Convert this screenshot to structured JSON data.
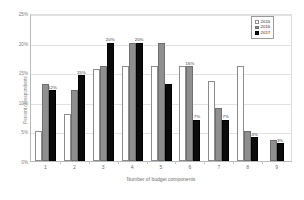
{
  "chart_data": {
    "type": "bar",
    "title": "",
    "xlabel": "Number of budget components",
    "ylabel": "Percent of respondents",
    "categories": [
      "1",
      "2",
      "3",
      "4",
      "5",
      "6",
      "7",
      "8",
      "9"
    ],
    "ylim": [
      0,
      25
    ],
    "yticks": [
      "0%",
      "5%",
      "10%",
      "15%",
      "20%",
      "25%"
    ],
    "ytick_values": [
      0,
      5,
      10,
      15,
      20,
      25
    ],
    "grid": true,
    "legend_position": "top-right",
    "series": [
      {
        "name": "2015",
        "color": "#ffffff",
        "values": [
          5,
          8,
          15.5,
          16,
          16,
          16,
          13.5,
          16,
          0
        ],
        "labels": [
          "",
          "",
          "",
          "",
          "",
          "",
          "",
          "",
          ""
        ]
      },
      {
        "name": "2016",
        "color": "#8f8f8f",
        "values": [
          13,
          12,
          16,
          20,
          20,
          16,
          9,
          5,
          3.5
        ],
        "labels": [
          "",
          "",
          "",
          "",
          "",
          "16%",
          "",
          "",
          ""
        ]
      },
      {
        "name": "2017",
        "color": "#0b0b0b",
        "values": [
          12,
          14.5,
          20,
          20,
          13,
          7,
          7,
          4,
          3
        ],
        "labels": [
          "12%",
          "15%",
          "20%",
          "20%",
          "",
          "7%",
          "7%",
          "4%",
          "3%"
        ]
      }
    ]
  },
  "legend": {
    "items": [
      {
        "label": "2015"
      },
      {
        "label": "2016"
      },
      {
        "label": "2017"
      }
    ]
  }
}
